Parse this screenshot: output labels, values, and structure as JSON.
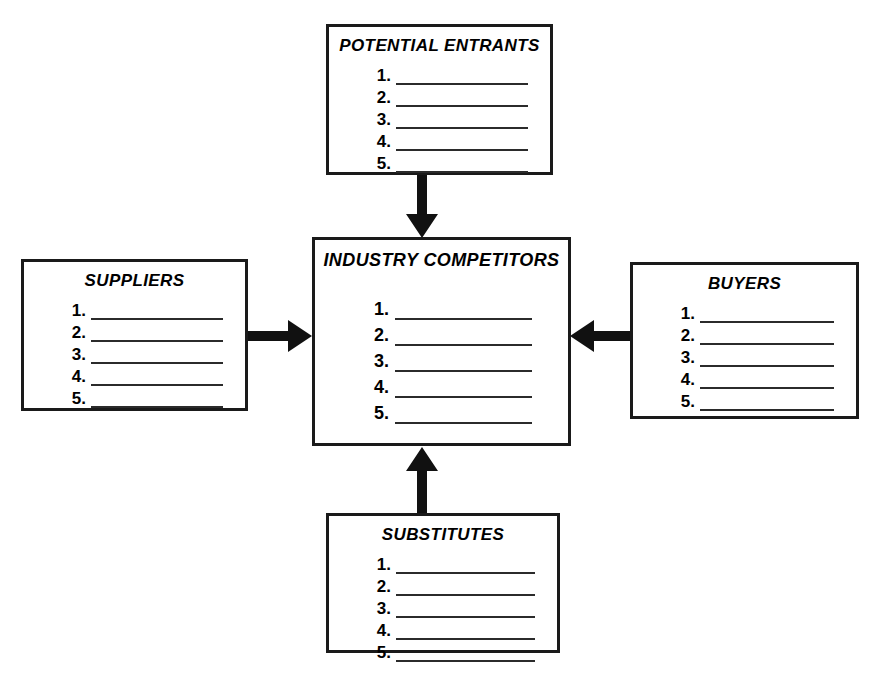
{
  "diagram": {
    "line_count": 5,
    "line_numbers": [
      "1.",
      "2.",
      "3.",
      "4.",
      "5."
    ],
    "boxes": {
      "potential_entrants": {
        "title": "POTENTIAL ENTRANTS",
        "items": [
          "1.",
          "2.",
          "3.",
          "4.",
          "5."
        ]
      },
      "industry_competitors": {
        "title": "INDUSTRY COMPETITORS",
        "items": [
          "1.",
          "2.",
          "3.",
          "4.",
          "5."
        ]
      },
      "suppliers": {
        "title": "SUPPLIERS",
        "items": [
          "1.",
          "2.",
          "3.",
          "4.",
          "5."
        ]
      },
      "buyers": {
        "title": "BUYERS",
        "items": [
          "1.",
          "2.",
          "3.",
          "4.",
          "5."
        ]
      },
      "substitutes": {
        "title": "SUBSTITUTES",
        "items": [
          "1.",
          "2.",
          "3.",
          "4.",
          "5."
        ]
      }
    },
    "arrows": [
      {
        "name": "entrants-to-competitors",
        "from": "POTENTIAL ENTRANTS",
        "to": "INDUSTRY COMPETITORS",
        "direction": "down"
      },
      {
        "name": "suppliers-to-competitors",
        "from": "SUPPLIERS",
        "to": "INDUSTRY COMPETITORS",
        "direction": "right"
      },
      {
        "name": "buyers-to-competitors",
        "from": "BUYERS",
        "to": "INDUSTRY COMPETITORS",
        "direction": "left"
      },
      {
        "name": "substitutes-to-competitors",
        "from": "SUBSTITUTES",
        "to": "INDUSTRY COMPETITORS",
        "direction": "up"
      }
    ],
    "colors": {
      "background": "#ffffff",
      "border": "#1a1a1a",
      "text": "#000000",
      "rule": "#2b2b2b",
      "arrow": "#111111"
    }
  }
}
